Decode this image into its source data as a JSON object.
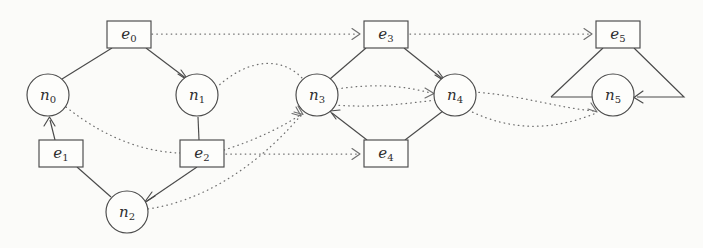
{
  "figure": {
    "kind": "directed-graph-diagram",
    "background_color": "#fbfbf9",
    "stroke_color": "#4a4a4a",
    "dotted_stroke_color": "#6f6f6f",
    "width": 703,
    "height": 248
  },
  "nodes": [
    {
      "id": "n0",
      "shape": "circle",
      "label_base": "n",
      "label_sub": "0",
      "cx": 48,
      "cy": 95,
      "r": 21
    },
    {
      "id": "n1",
      "shape": "circle",
      "label_base": "n",
      "label_sub": "1",
      "cx": 197,
      "cy": 95,
      "r": 21
    },
    {
      "id": "n2",
      "shape": "circle",
      "label_base": "n",
      "label_sub": "2",
      "cx": 127,
      "cy": 212,
      "r": 21
    },
    {
      "id": "n3",
      "shape": "circle",
      "label_base": "n",
      "label_sub": "3",
      "cx": 317,
      "cy": 95,
      "r": 21
    },
    {
      "id": "n4",
      "shape": "circle",
      "label_base": "n",
      "label_sub": "4",
      "cx": 455,
      "cy": 95,
      "r": 21
    },
    {
      "id": "n5",
      "shape": "circle",
      "label_base": "n",
      "label_sub": "5",
      "cx": 613,
      "cy": 95,
      "r": 21
    },
    {
      "id": "e0",
      "shape": "rect",
      "label_base": "e",
      "label_sub": "0",
      "x": 107,
      "y": 21,
      "w": 44,
      "h": 27
    },
    {
      "id": "e1",
      "shape": "rect",
      "label_base": "e",
      "label_sub": "1",
      "x": 39,
      "y": 140,
      "w": 44,
      "h": 27
    },
    {
      "id": "e2",
      "shape": "rect",
      "label_base": "e",
      "label_sub": "2",
      "x": 180,
      "y": 140,
      "w": 44,
      "h": 27
    },
    {
      "id": "e3",
      "shape": "rect",
      "label_base": "e",
      "label_sub": "3",
      "x": 364,
      "y": 21,
      "w": 44,
      "h": 27
    },
    {
      "id": "e4",
      "shape": "rect",
      "label_base": "e",
      "label_sub": "4",
      "x": 364,
      "y": 140,
      "w": 44,
      "h": 27
    },
    {
      "id": "e5",
      "shape": "rect",
      "label_base": "e",
      "label_sub": "5",
      "x": 596,
      "y": 21,
      "w": 44,
      "h": 27
    }
  ],
  "edges_solid": [
    {
      "from": "e0",
      "to": "n0",
      "arrow": false,
      "path": "M 112 48 L 62 78"
    },
    {
      "from": "e0",
      "to": "n1",
      "arrow": true,
      "path": "M 145 48 L 188 80"
    },
    {
      "from": "e1",
      "to": "n0",
      "arrow": true,
      "path": "M 56 140 L 49 119"
    },
    {
      "from": "e1",
      "to": "n2",
      "arrow": false,
      "path": "M 76 167 L 112 196"
    },
    {
      "from": "e2",
      "to": "n1",
      "arrow": false,
      "path": "M 199 140 L 198 116"
    },
    {
      "from": "e2",
      "to": "n2",
      "arrow": true,
      "path": "M 196 167 L 146 202"
    },
    {
      "from": "e3",
      "to": "n3",
      "arrow": false,
      "path": "M 366 48 L 330 78"
    },
    {
      "from": "e3",
      "to": "n4",
      "arrow": true,
      "path": "M 404 48 L 445 80"
    },
    {
      "from": "e4",
      "to": "n3",
      "arrow": true,
      "path": "M 368 140 L 331 113"
    },
    {
      "from": "e4",
      "to": "n4",
      "arrow": false,
      "path": "M 404 140 L 444 110"
    },
    {
      "from": "e5",
      "to": "n5",
      "arrow": false,
      "path": "M 602 48 L 550 98"
    },
    {
      "from": "e5",
      "to": "n5",
      "arrow": true,
      "path": "M 634 48 L 683 98 L 637 98"
    },
    {
      "from": "loop",
      "to": "n5",
      "arrow": false,
      "path": "M 550 98 L 592 98"
    }
  ],
  "edges_dotted": [
    {
      "from": "e0",
      "to": "e3",
      "arrow": true,
      "path": "M 152 34 L 358 34"
    },
    {
      "from": "e3",
      "to": "e5",
      "arrow": true,
      "path": "M 410 34 L 590 34"
    },
    {
      "from": "e2",
      "to": "e4",
      "arrow": true,
      "path": "M 226 154 L 358 154"
    },
    {
      "from": "n0",
      "to": "e2",
      "arrow": false,
      "path": "M 66 107 C 110 142 150 152 180 153"
    },
    {
      "from": "n1",
      "to": "n3",
      "arrow": false,
      "path": "M 216 88 C 248 60 280 58 302 80"
    },
    {
      "from": "n2",
      "to": "n3",
      "arrow": true,
      "path": "M 147 210 C 215 198 268 150 303 112"
    },
    {
      "from": "e2",
      "to": "n3",
      "arrow": true,
      "path": "M 224 148 C 258 138 285 125 302 112"
    },
    {
      "from": "n3",
      "to": "n4",
      "arrow": true,
      "path": "M 337 91 C 375 86 405 88 433 93"
    },
    {
      "from": "n3",
      "to": "n4",
      "arrow": false,
      "path": "M 334 104 C 372 106 404 102 437 99"
    },
    {
      "from": "n4",
      "to": "n5",
      "arrow": true,
      "path": "M 474 92 C 520 96 560 110 597 110"
    },
    {
      "from": "n4",
      "to": "n5",
      "arrow": false,
      "path": "M 470 108 C 518 130 560 126 597 112"
    }
  ],
  "legend": {
    "solid_meaning": "incidence",
    "dotted_meaning": "ordering"
  }
}
